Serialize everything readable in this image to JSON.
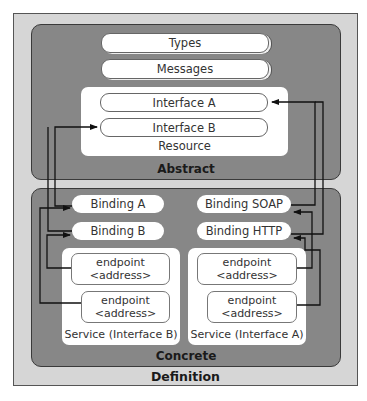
{
  "definition": {
    "label": "Definition",
    "abstract": {
      "label": "Abstract",
      "types": "Types",
      "messages": "Messages",
      "resource": {
        "label": "Resource",
        "interfaces": [
          "Interface A",
          "Interface B"
        ]
      }
    },
    "concrete": {
      "label": "Concrete",
      "bindings_left": [
        "Binding A",
        "Binding B"
      ],
      "bindings_right": [
        "Binding SOAP",
        "Binding HTTP"
      ],
      "services": [
        {
          "label": "Service (Interface B)",
          "endpoints": [
            {
              "line1": "endpoint",
              "line2": "<address>"
            },
            {
              "line1": "endpoint",
              "line2": "<address>"
            }
          ]
        },
        {
          "label": "Service (Interface A)",
          "endpoints": [
            {
              "line1": "endpoint",
              "line2": "<address>"
            },
            {
              "line1": "endpoint",
              "line2": "<address>"
            }
          ]
        }
      ]
    }
  },
  "colors": {
    "definition_bg": "#d6d6d6",
    "panel_bg": "#878787",
    "box_bg": "#ffffff",
    "line": "#111111"
  }
}
